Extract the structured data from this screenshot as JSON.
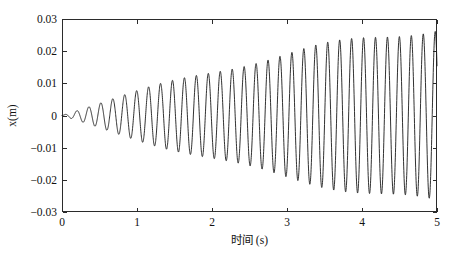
{
  "chart_data": {
    "type": "line",
    "title": "",
    "subtitle": "",
    "xlabel": "时间 (s)",
    "ylabel": "x(m)",
    "xlim": [
      0,
      5
    ],
    "ylim": [
      -0.03,
      0.03
    ],
    "xticks": [
      0,
      1,
      2,
      3,
      4,
      5
    ],
    "xtick_labels": [
      "0",
      "1",
      "2",
      "3",
      "4",
      "5"
    ],
    "yticks": [
      -0.03,
      -0.02,
      -0.01,
      0,
      0.01,
      0.02,
      0.03
    ],
    "ytick_labels": [
      "−0.03",
      "−0.02",
      "−0.01",
      "0",
      "0.01",
      "0.02",
      "0.03"
    ],
    "grid": false,
    "legend": null,
    "legend_position": "none",
    "box_frame": true,
    "tick_direction": "in",
    "line_color": "#1a1a1a",
    "line_width": 0.9,
    "series": [
      {
        "name": "x(t)",
        "color": "#1a1a1a",
        "model": {
          "form": "envelope_times_sine",
          "frequency_hz": 6.28,
          "phase_rad": 0,
          "envelope_type": "saturating_linear",
          "envelope_max": 0.0275,
          "envelope_tau_s": 6.2,
          "beat_depth": 0.055,
          "beat_frequency_hz": 0.42,
          "t_start": 0,
          "t_end": 5,
          "samples": 2600
        },
        "key_points": [
          {
            "t": 0.0,
            "x": 0.0
          },
          {
            "t": 0.1,
            "x": 0.0014
          },
          {
            "t": 0.25,
            "x": -0.0022
          },
          {
            "t": 0.5,
            "x": 0.0035
          },
          {
            "t": 0.75,
            "x": -0.0048
          },
          {
            "t": 1.0,
            "x": 0.0062
          },
          {
            "t": 1.5,
            "x": -0.009
          },
          {
            "t": 2.0,
            "x": 0.0122
          },
          {
            "t": 2.5,
            "x": -0.0151
          },
          {
            "t": 3.0,
            "x": 0.0178
          },
          {
            "t": 3.5,
            "x": -0.0203
          },
          {
            "t": 4.0,
            "x": 0.0224
          },
          {
            "t": 4.5,
            "x": -0.0245
          },
          {
            "t": 4.85,
            "x": 0.0272
          },
          {
            "t": 5.0,
            "x": -0.0265
          }
        ],
        "envelope_samples": [
          {
            "t": 0.0,
            "amplitude": 0.0
          },
          {
            "t": 0.25,
            "amplitude": 0.0022
          },
          {
            "t": 0.5,
            "amplitude": 0.0036
          },
          {
            "t": 1.0,
            "amplitude": 0.0064
          },
          {
            "t": 1.5,
            "amplitude": 0.0092
          },
          {
            "t": 2.0,
            "amplitude": 0.0123
          },
          {
            "t": 2.5,
            "amplitude": 0.0152
          },
          {
            "t": 3.0,
            "amplitude": 0.0179
          },
          {
            "t": 3.5,
            "amplitude": 0.0204
          },
          {
            "t": 4.0,
            "amplitude": 0.0226
          },
          {
            "t": 4.5,
            "amplitude": 0.0248
          },
          {
            "t": 5.0,
            "amplitude": 0.0272
          }
        ]
      }
    ]
  },
  "plot_box": {
    "left_px": 62,
    "top_px": 19,
    "right_px": 437,
    "bottom_px": 212
  }
}
